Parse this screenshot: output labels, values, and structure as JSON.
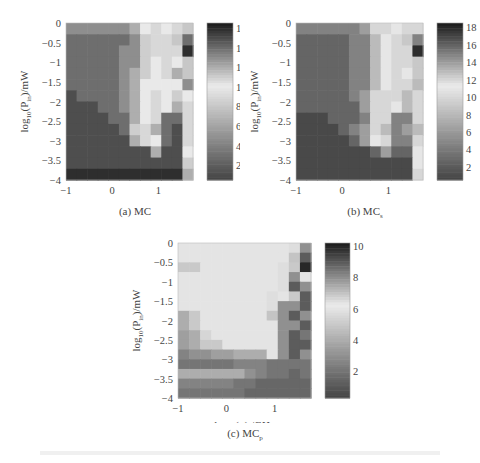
{
  "chart_data": [
    {
      "type": "heatmap",
      "id": "a",
      "caption": "(a) MC",
      "caption_main": "(a) MC",
      "caption_sub": "",
      "xlabel": "log10(η) /GHz",
      "ylabel": "log10(Pin)/mW",
      "xlim": [
        -1,
        1.75
      ],
      "ylim": [
        -4,
        0
      ],
      "xticks": [
        "-1",
        "0",
        "1"
      ],
      "yticks": [
        "0",
        "-0.5",
        "-1",
        "-1.5",
        "-2",
        "-2.5",
        "-3",
        "-3.5",
        "-4"
      ],
      "colorbar": {
        "min": 0.5,
        "max": 16.5,
        "ticks": [
          "16",
          "14",
          "12",
          "10",
          "8",
          "6",
          "4",
          "2"
        ]
      },
      "cmap": "gray-center-light",
      "grid_rows_top_to_bottom": [
        [
          13,
          13,
          13,
          13,
          13,
          13,
          12,
          10,
          9,
          10,
          9,
          8
        ],
        [
          14,
          14,
          14,
          14,
          14,
          14,
          13,
          11,
          9,
          9,
          8,
          14
        ],
        [
          14,
          14,
          14,
          14,
          14,
          13,
          13,
          11,
          9,
          9,
          9,
          16
        ],
        [
          14,
          14,
          14,
          14,
          14,
          13,
          13,
          11,
          10,
          9,
          10,
          8
        ],
        [
          14,
          14,
          14,
          14,
          14,
          13,
          12,
          11,
          10,
          9,
          12,
          8
        ],
        [
          14,
          14,
          14,
          14,
          14,
          13,
          12,
          10,
          10,
          10,
          10,
          13
        ],
        [
          15,
          14,
          14,
          14,
          14,
          13,
          12,
          10,
          9,
          10,
          11,
          10
        ],
        [
          15,
          15,
          15,
          14,
          14,
          13,
          12,
          10,
          9,
          10,
          12,
          9
        ],
        [
          15,
          15,
          15,
          15,
          14,
          14,
          12,
          10,
          9,
          14,
          14,
          9
        ],
        [
          15,
          15,
          15,
          15,
          15,
          14,
          11,
          9,
          12,
          14,
          15,
          9
        ],
        [
          15,
          15,
          15,
          15,
          15,
          15,
          12,
          9,
          10,
          14,
          15,
          9
        ],
        [
          15,
          15,
          15,
          15,
          15,
          15,
          15,
          15,
          12,
          15,
          15,
          10
        ],
        [
          15,
          15,
          15,
          15,
          15,
          15,
          15,
          15,
          15,
          15,
          15,
          11
        ],
        [
          16,
          16,
          16,
          16,
          16,
          16,
          16,
          16,
          16,
          16,
          16,
          12
        ]
      ]
    },
    {
      "type": "heatmap",
      "id": "b",
      "caption_main": "(b) MC",
      "caption_sub": "s",
      "xlabel": "log10(η) /GHz",
      "ylabel": "log10(Pin)/mW",
      "xlim": [
        -1,
        1.75
      ],
      "ylim": [
        -4,
        0
      ],
      "xticks": [
        "-1",
        "0",
        "1"
      ],
      "yticks": [
        "0",
        "-0.5",
        "-1",
        "-1.5",
        "-2",
        "-2.5",
        "-3",
        "-3.5",
        "-4"
      ],
      "colorbar": {
        "min": 0.5,
        "max": 18.5,
        "ticks": [
          "18",
          "16",
          "14",
          "12",
          "10",
          "8",
          "6",
          "4",
          "2"
        ]
      },
      "cmap": "gray-center-light",
      "grid_rows_top_to_bottom": [
        [
          15,
          15,
          15,
          15,
          15,
          15,
          14,
          12,
          10,
          11,
          10,
          10
        ],
        [
          16,
          16,
          16,
          16,
          16,
          15,
          15,
          13,
          11,
          10,
          9,
          15
        ],
        [
          16,
          16,
          16,
          16,
          16,
          15,
          15,
          13,
          11,
          10,
          10,
          18
        ],
        [
          16,
          16,
          16,
          16,
          16,
          15,
          15,
          13,
          11,
          10,
          10,
          9
        ],
        [
          16,
          16,
          16,
          16,
          16,
          15,
          15,
          13,
          11,
          10,
          11,
          9
        ],
        [
          16,
          16,
          16,
          16,
          16,
          15,
          15,
          13,
          11,
          10,
          10,
          13
        ],
        [
          16,
          16,
          16,
          16,
          16,
          15,
          14,
          12,
          10,
          10,
          13,
          10
        ],
        [
          16,
          16,
          16,
          16,
          16,
          16,
          14,
          12,
          10,
          11,
          13,
          10
        ],
        [
          17,
          17,
          17,
          16,
          16,
          16,
          15,
          12,
          10,
          15,
          15,
          10
        ],
        [
          17,
          17,
          17,
          17,
          16,
          15,
          14,
          10,
          13,
          15,
          14,
          13
        ],
        [
          17,
          17,
          17,
          17,
          17,
          16,
          14,
          11,
          12,
          15,
          15,
          10
        ],
        [
          17,
          17,
          17,
          17,
          17,
          17,
          17,
          16,
          14,
          16,
          16,
          11
        ],
        [
          17,
          17,
          17,
          17,
          17,
          17,
          17,
          17,
          17,
          17,
          17,
          11
        ],
        [
          17,
          17,
          17,
          17,
          17,
          17,
          17,
          17,
          17,
          17,
          17,
          12
        ]
      ]
    },
    {
      "type": "heatmap",
      "id": "c",
      "caption_main": "(c) MC",
      "caption_sub": "p",
      "xlabel": "log10(η) /GHz",
      "ylabel": "log10(Pin)/mW",
      "xlim": [
        -1,
        1.75
      ],
      "ylim": [
        -4,
        0
      ],
      "xticks": [
        "-1",
        "0",
        "1"
      ],
      "yticks": [
        "0",
        "-0.5",
        "-1",
        "-1.5",
        "-2",
        "-2.5",
        "-3",
        "-3.5",
        "-4"
      ],
      "colorbar": {
        "min": 0.3,
        "max": 10.2,
        "ticks": [
          "10",
          "8",
          "6",
          "4",
          "2"
        ]
      },
      "cmap": "gray-center-light",
      "grid_rows_top_to_bottom": [
        [
          6,
          6,
          6,
          6,
          6,
          6,
          6,
          6,
          6,
          6,
          6.5,
          8
        ],
        [
          6,
          6,
          6,
          6,
          6,
          6,
          6,
          6,
          6,
          6,
          7,
          9
        ],
        [
          5,
          5,
          6,
          6,
          6,
          6,
          6,
          6,
          6,
          6.5,
          5,
          10
        ],
        [
          6,
          6,
          6,
          6,
          6,
          6,
          6,
          6,
          6,
          6.5,
          8,
          6
        ],
        [
          6,
          6,
          6,
          6,
          6,
          6,
          6,
          6,
          6,
          6.5,
          9,
          8
        ],
        [
          6,
          6,
          6,
          6,
          6,
          6,
          6,
          6,
          6.5,
          6,
          5,
          9
        ],
        [
          6,
          6,
          6,
          6,
          6,
          6,
          6,
          6,
          6.5,
          8,
          8,
          9
        ],
        [
          4,
          5,
          6,
          6,
          6,
          6,
          6,
          6,
          7,
          8,
          9,
          8
        ],
        [
          4,
          5,
          6,
          6,
          6,
          6,
          6,
          6,
          6,
          8,
          8,
          9
        ],
        [
          3.5,
          4,
          5.5,
          6,
          6,
          6,
          6,
          6,
          6,
          8,
          9,
          8.5
        ],
        [
          3.5,
          4,
          5,
          5,
          6,
          6,
          6,
          6,
          6,
          8,
          9,
          9
        ],
        [
          2.5,
          3,
          3,
          3.5,
          3.5,
          4,
          4,
          4,
          6,
          8,
          9,
          8
        ],
        [
          2,
          2,
          2,
          2,
          2,
          2.5,
          2.5,
          2.5,
          2,
          2,
          2,
          2
        ],
        [
          4,
          4,
          4,
          4,
          4,
          4,
          3,
          2.5,
          2,
          2,
          1.5,
          2
        ],
        [
          2.5,
          2.5,
          2.5,
          2.5,
          2.5,
          2,
          2,
          1.5,
          1.5,
          1.5,
          1.5,
          1.5
        ],
        [
          2,
          2,
          2,
          2,
          2,
          2,
          1.5,
          1.5,
          1.5,
          1.5,
          1.5,
          1.5
        ]
      ]
    }
  ]
}
